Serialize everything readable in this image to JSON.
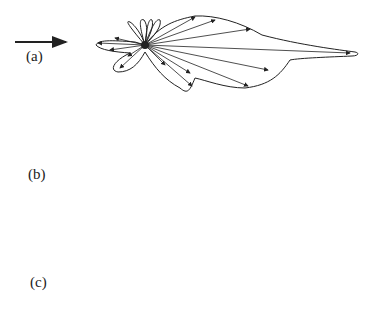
{
  "figure": {
    "panels": [
      {
        "label": "(a)",
        "incident_arrow": "right-arrow",
        "pattern": "forward-lobe-with-side-lobes"
      },
      {
        "label": "(b)",
        "incident_arrow": "right-arrow",
        "pattern": "near-isotropic-peanut"
      },
      {
        "label": "(c)",
        "incident_arrow": "right-arrow",
        "pattern": "narrow-forward-beam-with-back-lobes"
      }
    ]
  },
  "colors": {
    "line": "#222222",
    "background": "#ffffff"
  }
}
